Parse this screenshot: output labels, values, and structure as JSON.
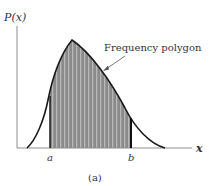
{
  "figure": {
    "y_axis_label": "P(x)",
    "x_axis_label": "x",
    "annotation": "Frequency polygon",
    "marker_a": "a",
    "marker_b": "b",
    "caption": "(a)"
  },
  "colors": {
    "fill": "#8a8a8a",
    "stripe": "#b5b5b5",
    "curve": "#1a1a1a",
    "axis": "#888888"
  }
}
